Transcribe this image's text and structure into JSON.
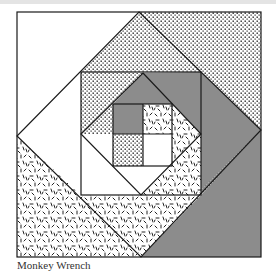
{
  "caption": "Monkey Wrench",
  "colors": {
    "line": "#1a1a1a",
    "gray": "#8c8c8c",
    "white": "#ffffff",
    "dot": "#222222",
    "background": "#ffffff",
    "top_strip": "#e4e4e4"
  },
  "geometry": {
    "outer_square": {
      "x1": 17,
      "y1": 12,
      "x2": 261,
      "y2": 257
    },
    "outer_diamond": {
      "top": [
        139,
        12
      ],
      "right": [
        261,
        130
      ],
      "bottom": [
        141,
        257
      ],
      "left": [
        17,
        136
      ]
    },
    "middle_square": {
      "x1": 81,
      "y1": 72,
      "x2": 201,
      "y2": 195
    },
    "inner_diamond": {
      "top": [
        143,
        73
      ],
      "right": [
        201,
        134
      ],
      "bottom": [
        141,
        195
      ],
      "left": [
        81,
        134
      ]
    },
    "center_square": {
      "x1": 113,
      "y1": 104,
      "x2": 172,
      "y2": 166,
      "mx": 143,
      "my": 134
    }
  },
  "fills": {
    "outer_corners": {
      "top_left": "white",
      "top_right": "stipple",
      "bottom_right": "gray",
      "bottom_left": "confetti"
    },
    "diamond_ring": {
      "top": "stipple",
      "right": "gray",
      "bottom": "confetti",
      "left": "white"
    },
    "middle_corners": {
      "top_left": "stipple",
      "top_right": "gray",
      "bottom_right": "confetti",
      "bottom_left": "white"
    },
    "inner_ring": {
      "top": "gray",
      "right": "confetti",
      "bottom": "white",
      "left": "stipple"
    },
    "center": {
      "top_left": "gray",
      "top_right": "confetti",
      "bottom_left": "stipple",
      "bottom_right": "white"
    }
  }
}
